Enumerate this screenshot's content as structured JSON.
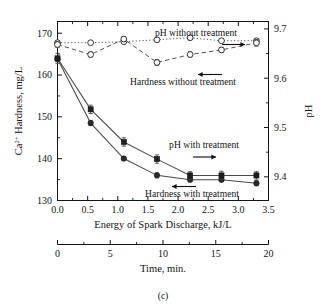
{
  "figure": {
    "caption": "(c)"
  },
  "axes": {
    "left": {
      "title_main": "Ca",
      "title_sup": "2+",
      "title_rest": " Hardness, mg/L",
      "ticks": [
        "130",
        "140",
        "150",
        "160",
        "170"
      ],
      "min": 130,
      "max": 172.8
    },
    "right": {
      "title": "pH",
      "ticks": [
        "9.4",
        "9.5",
        "9.6",
        "9.7"
      ],
      "min": 9.352,
      "max": 9.715
    },
    "bottom_primary": {
      "title": "Energy of Spark Discharge, kJ/L",
      "ticks": [
        "0.0",
        "0.5",
        "1.0",
        "1.5",
        "2.0",
        "2.5",
        "3.0",
        "3.5"
      ],
      "min": 0.0,
      "max": 3.5
    },
    "bottom_secondary": {
      "title": "Time, min.",
      "ticks": [
        "0",
        "5",
        "10",
        "15",
        "20"
      ],
      "min": 0,
      "max": 20
    }
  },
  "annotations": [
    {
      "name": "ph-without-treatment",
      "text": "pH without treatment",
      "arrow": "right"
    },
    {
      "name": "hardness-without-treatment",
      "text": "Hardness without treatment",
      "arrow": "left"
    },
    {
      "name": "ph-with-treatment",
      "text": "pH with treatment",
      "arrow": "right"
    },
    {
      "name": "hardness-with-treatment",
      "text": "Hardness with treatment",
      "arrow": "left"
    }
  ],
  "chart_data": {
    "type": "line",
    "title": "",
    "xlabel": "Energy of Spark Discharge, kJ/L",
    "xlabel_secondary": "Time, min.",
    "ylabel": "Ca2+ Hardness, mg/L",
    "ylabel_right": "pH",
    "xlim": [
      0.0,
      3.5
    ],
    "xlim_secondary": [
      0,
      20
    ],
    "ylim": [
      130,
      172.8
    ],
    "ylim_right": [
      9.352,
      9.715
    ],
    "grid": false,
    "legend": "inline-annotations",
    "x": [
      0.0,
      0.55,
      1.1,
      1.65,
      2.2,
      2.72,
      3.3
    ],
    "x_time_min": [
      0.0,
      3.1,
      6.3,
      9.4,
      12.6,
      15.5,
      18.9
    ],
    "series": [
      {
        "name": "pH without treatment",
        "axis": "right",
        "marker": "open-circle",
        "line": "dotted",
        "values": [
          9.672,
          9.672,
          9.674,
          9.678,
          9.682,
          9.676,
          9.676
        ],
        "errors": [
          0.004,
          0.003,
          0.003,
          0.003,
          0.004,
          0.003,
          0.004
        ]
      },
      {
        "name": "Hardness without treatment",
        "axis": "left",
        "marker": "open-circle",
        "line": "dashed",
        "values": [
          167.3,
          164.9,
          168.6,
          163.0,
          164.9,
          166.0,
          167.7
        ],
        "errors": [
          0.7,
          0.6,
          0.6,
          0.7,
          0.6,
          0.6,
          0.8
        ]
      },
      {
        "name": "pH with treatment",
        "axis": "right",
        "marker": "filled-circle",
        "line": "solid",
        "values": [
          9.639,
          9.509,
          9.437,
          9.403,
          9.394,
          9.394,
          9.387
        ],
        "errors": [
          0.005,
          0.005,
          0.004,
          0.005,
          0.004,
          0.004,
          0.005
        ]
      },
      {
        "name": "Hardness with treatment",
        "axis": "left",
        "marker": "filled-square",
        "line": "solid",
        "values": [
          164.0,
          151.8,
          144.0,
          139.9,
          136.0,
          136.0,
          136.0
        ],
        "errors": [
          1.2,
          1.0,
          1.0,
          1.0,
          0.9,
          1.0,
          0.9
        ]
      }
    ]
  }
}
